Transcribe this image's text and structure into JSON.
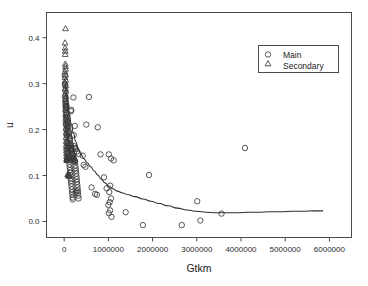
{
  "chart_data": {
    "type": "scatter",
    "title": "",
    "subtitle": "",
    "xlabel": "Gtkm",
    "ylabel": "u",
    "xlim": [
      -400000,
      6500000
    ],
    "ylim": [
      -0.035,
      0.455
    ],
    "grid": false,
    "legend_position": "top-right",
    "xticks": [
      0,
      1000000,
      2000000,
      3000000,
      4000000,
      5000000,
      6000000
    ],
    "xtick_labels": [
      "0",
      "1000000",
      "2000000",
      "3000000",
      "4000000",
      "5000000",
      "6000000"
    ],
    "yticks": [
      0.0,
      0.1,
      0.2,
      0.3,
      0.4
    ],
    "ytick_labels": [
      "0.0",
      "0.1",
      "0.2",
      "0.3",
      "0.4"
    ],
    "marker_colors": {
      "main": "#3a3a3a",
      "secondary": "#3a3a3a",
      "trend": "#2e2e2e",
      "axis": "#4a4a4a"
    },
    "series": [
      {
        "name": "Main",
        "marker": "circle",
        "points": [
          [
            12000,
            0.318
          ],
          [
            16000,
            0.3
          ],
          [
            22000,
            0.296
          ],
          [
            26000,
            0.285
          ],
          [
            20000,
            0.272
          ],
          [
            30000,
            0.268
          ],
          [
            34000,
            0.262
          ],
          [
            28000,
            0.256
          ],
          [
            40000,
            0.25
          ],
          [
            44000,
            0.248
          ],
          [
            36000,
            0.243
          ],
          [
            52000,
            0.252
          ],
          [
            160000,
            0.243
          ],
          [
            155000,
            0.24
          ],
          [
            48000,
            0.236
          ],
          [
            56000,
            0.232
          ],
          [
            60000,
            0.228
          ],
          [
            42000,
            0.224
          ],
          [
            66000,
            0.22
          ],
          [
            70000,
            0.216
          ],
          [
            38000,
            0.213
          ],
          [
            74000,
            0.21
          ],
          [
            80000,
            0.207
          ],
          [
            86000,
            0.204
          ],
          [
            92000,
            0.213
          ],
          [
            54000,
            0.2
          ],
          [
            98000,
            0.197
          ],
          [
            104000,
            0.194
          ],
          [
            110000,
            0.191
          ],
          [
            62000,
            0.188
          ],
          [
            116000,
            0.185
          ],
          [
            122000,
            0.182
          ],
          [
            215000,
            0.188
          ],
          [
            128000,
            0.179
          ],
          [
            134000,
            0.176
          ],
          [
            76000,
            0.172
          ],
          [
            140000,
            0.17
          ],
          [
            146000,
            0.167
          ],
          [
            152000,
            0.164
          ],
          [
            88000,
            0.161
          ],
          [
            158000,
            0.16
          ],
          [
            164000,
            0.158
          ],
          [
            225000,
            0.164
          ],
          [
            245000,
            0.16
          ],
          [
            260000,
            0.158
          ],
          [
            170000,
            0.155
          ],
          [
            176000,
            0.152
          ],
          [
            94000,
            0.15
          ],
          [
            182000,
            0.148
          ],
          [
            188000,
            0.146
          ],
          [
            290000,
            0.152
          ],
          [
            194000,
            0.144
          ],
          [
            200000,
            0.142
          ],
          [
            206000,
            0.14
          ],
          [
            100000,
            0.138
          ],
          [
            212000,
            0.137
          ],
          [
            218000,
            0.136
          ],
          [
            224000,
            0.135
          ],
          [
            106000,
            0.134
          ],
          [
            230000,
            0.133
          ],
          [
            236000,
            0.132
          ],
          [
            242000,
            0.131
          ],
          [
            112000,
            0.13
          ],
          [
            248000,
            0.129
          ],
          [
            330000,
            0.147
          ],
          [
            420000,
            0.143
          ],
          [
            500000,
            0.211
          ],
          [
            560000,
            0.271
          ],
          [
            760000,
            0.205
          ],
          [
            820000,
            0.146
          ],
          [
            1060000,
            0.137
          ],
          [
            1120000,
            0.133
          ],
          [
            1010000,
            0.146
          ],
          [
            118000,
            0.124
          ],
          [
            254000,
            0.122
          ],
          [
            124000,
            0.118
          ],
          [
            260000,
            0.116
          ],
          [
            440000,
            0.123
          ],
          [
            480000,
            0.119
          ],
          [
            130000,
            0.112
          ],
          [
            266000,
            0.11
          ],
          [
            136000,
            0.106
          ],
          [
            272000,
            0.104
          ],
          [
            142000,
            0.1
          ],
          [
            278000,
            0.098
          ],
          [
            148000,
            0.094
          ],
          [
            284000,
            0.092
          ],
          [
            154000,
            0.088
          ],
          [
            290000,
            0.086
          ],
          [
            160000,
            0.082
          ],
          [
            296000,
            0.08
          ],
          [
            166000,
            0.076
          ],
          [
            302000,
            0.074
          ],
          [
            172000,
            0.07
          ],
          [
            308000,
            0.068
          ],
          [
            178000,
            0.064
          ],
          [
            314000,
            0.062
          ],
          [
            184000,
            0.058
          ],
          [
            320000,
            0.056
          ],
          [
            190000,
            0.052
          ],
          [
            326000,
            0.05
          ],
          [
            196000,
            0.048
          ],
          [
            260000,
            0.062
          ],
          [
            280000,
            0.066
          ],
          [
            620000,
            0.074
          ],
          [
            700000,
            0.06
          ],
          [
            740000,
            0.058
          ],
          [
            900000,
            0.096
          ],
          [
            960000,
            0.072
          ],
          [
            1040000,
            0.078
          ],
          [
            1020000,
            0.064
          ],
          [
            1060000,
            0.05
          ],
          [
            1030000,
            0.042
          ],
          [
            1000000,
            0.036
          ],
          [
            1040000,
            0.024
          ],
          [
            1010000,
            0.018
          ],
          [
            1070000,
            0.01
          ],
          [
            1390000,
            0.02
          ],
          [
            1780000,
            -0.008
          ],
          [
            1920000,
            0.101
          ],
          [
            2660000,
            -0.008
          ],
          [
            3010000,
            0.044
          ],
          [
            3080000,
            0.002
          ],
          [
            3560000,
            0.017
          ],
          [
            4090000,
            0.16
          ],
          [
            210000,
            0.27
          ],
          [
            240000,
            0.208
          ]
        ]
      },
      {
        "name": "Secondary",
        "marker": "triangle",
        "points": [
          [
            30000,
            0.42
          ],
          [
            18000,
            0.389
          ],
          [
            20000,
            0.378
          ],
          [
            24000,
            0.371
          ],
          [
            22000,
            0.364
          ],
          [
            26000,
            0.343
          ],
          [
            28000,
            0.338
          ],
          [
            32000,
            0.332
          ],
          [
            16000,
            0.326
          ],
          [
            34000,
            0.32
          ],
          [
            18000,
            0.314
          ],
          [
            36000,
            0.308
          ],
          [
            20000,
            0.302
          ],
          [
            38000,
            0.296
          ],
          [
            22000,
            0.29
          ],
          [
            40000,
            0.284
          ],
          [
            24000,
            0.278
          ],
          [
            42000,
            0.272
          ],
          [
            26000,
            0.266
          ],
          [
            44000,
            0.26
          ],
          [
            28000,
            0.254
          ],
          [
            46000,
            0.248
          ],
          [
            30000,
            0.243
          ],
          [
            48000,
            0.238
          ],
          [
            32000,
            0.233
          ],
          [
            50000,
            0.228
          ],
          [
            34000,
            0.223
          ],
          [
            52000,
            0.218
          ],
          [
            36000,
            0.213
          ],
          [
            54000,
            0.208
          ],
          [
            38000,
            0.203
          ],
          [
            56000,
            0.198
          ],
          [
            40000,
            0.193
          ],
          [
            58000,
            0.188
          ],
          [
            42000,
            0.183
          ],
          [
            60000,
            0.178
          ],
          [
            44000,
            0.174
          ],
          [
            62000,
            0.17
          ],
          [
            46000,
            0.166
          ],
          [
            64000,
            0.163
          ],
          [
            48000,
            0.16
          ],
          [
            66000,
            0.157
          ],
          [
            50000,
            0.154
          ],
          [
            68000,
            0.151
          ],
          [
            52000,
            0.148
          ],
          [
            70000,
            0.145
          ],
          [
            54000,
            0.142
          ],
          [
            72000,
            0.139
          ],
          [
            56000,
            0.137
          ],
          [
            74000,
            0.136
          ],
          [
            58000,
            0.135
          ],
          [
            76000,
            0.134
          ],
          [
            60000,
            0.133
          ],
          [
            120000,
            0.167
          ],
          [
            136000,
            0.164
          ],
          [
            150000,
            0.16
          ],
          [
            168000,
            0.157
          ],
          [
            180000,
            0.14
          ],
          [
            195000,
            0.137
          ],
          [
            96000,
            0.104
          ],
          [
            108000,
            0.101
          ],
          [
            118000,
            0.098
          ],
          [
            80000,
            0.102
          ],
          [
            90000,
            0.1
          ]
        ]
      }
    ],
    "trend": {
      "name": "loess-smooth",
      "points": [
        [
          20000,
          0.3
        ],
        [
          60000,
          0.268
        ],
        [
          110000,
          0.238
        ],
        [
          160000,
          0.212
        ],
        [
          210000,
          0.192
        ],
        [
          260000,
          0.174
        ],
        [
          320000,
          0.158
        ],
        [
          380000,
          0.146
        ],
        [
          450000,
          0.136
        ],
        [
          520000,
          0.128
        ],
        [
          600000,
          0.119
        ],
        [
          680000,
          0.11
        ],
        [
          760000,
          0.101
        ],
        [
          840000,
          0.092
        ],
        [
          920000,
          0.084
        ],
        [
          1010000,
          0.077
        ],
        [
          1100000,
          0.071
        ],
        [
          1200000,
          0.066
        ],
        [
          1320000,
          0.062
        ],
        [
          1450000,
          0.058
        ],
        [
          1600000,
          0.054
        ],
        [
          1780000,
          0.049
        ],
        [
          1960000,
          0.044
        ],
        [
          2150000,
          0.039
        ],
        [
          2350000,
          0.034
        ],
        [
          2560000,
          0.029
        ],
        [
          2780000,
          0.025
        ],
        [
          3000000,
          0.022
        ],
        [
          3220000,
          0.02
        ],
        [
          3450000,
          0.019
        ],
        [
          3680000,
          0.019
        ],
        [
          3920000,
          0.019
        ],
        [
          4160000,
          0.02
        ],
        [
          4400000,
          0.02
        ],
        [
          4650000,
          0.021
        ],
        [
          4900000,
          0.021
        ],
        [
          5150000,
          0.022
        ],
        [
          5400000,
          0.022
        ],
        [
          5650000,
          0.023
        ],
        [
          5850000,
          0.023
        ]
      ]
    }
  },
  "legend": {
    "entries": [
      {
        "label": "Main",
        "marker": "circle"
      },
      {
        "label": "Secondary",
        "marker": "triangle"
      }
    ]
  },
  "axes": {
    "x_title": "Gtkm",
    "y_title": "u"
  }
}
